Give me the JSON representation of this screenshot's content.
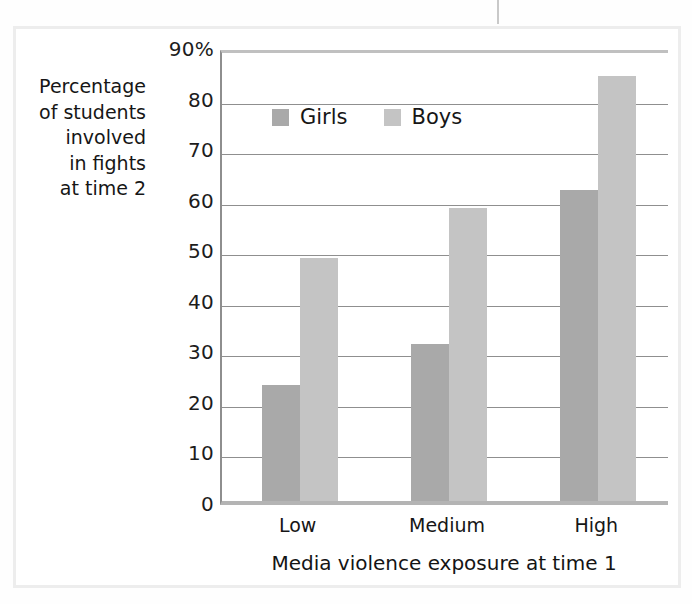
{
  "figure": {
    "frame_color": "#ededed",
    "background": "#ffffff"
  },
  "chart_data": {
    "type": "bar",
    "title": "",
    "subtitle": "",
    "xlabel": "Media violence exposure at time 1",
    "ylabel": "Percentage of students involved in fights at time 2",
    "ylabel_lines": [
      "Percentage",
      "of students",
      "involved",
      "in fights",
      "at time 2"
    ],
    "categories": [
      "Low",
      "Medium",
      "High"
    ],
    "series": [
      {
        "name": "Girls",
        "color": "#a9a9a9",
        "values": [
          23,
          31,
          61.5
        ]
      },
      {
        "name": "Boys",
        "color": "#c4c4c4",
        "values": [
          48,
          58,
          84
        ]
      }
    ],
    "ylim": [
      0,
      90
    ],
    "ytick_values": [
      0,
      10,
      20,
      30,
      40,
      50,
      60,
      70,
      80,
      90
    ],
    "ytick_labels": [
      "0",
      "10",
      "20",
      "30",
      "40",
      "50",
      "60",
      "70",
      "80",
      "90%"
    ],
    "grid": true,
    "grid_axis": "y",
    "legend_position": "top-left-inside",
    "legend_entries": [
      "Girls",
      "Boys"
    ],
    "bar_grouping": "adjacent-touching",
    "annotations": []
  },
  "axis_units": {
    "percent_suffix": "%"
  }
}
